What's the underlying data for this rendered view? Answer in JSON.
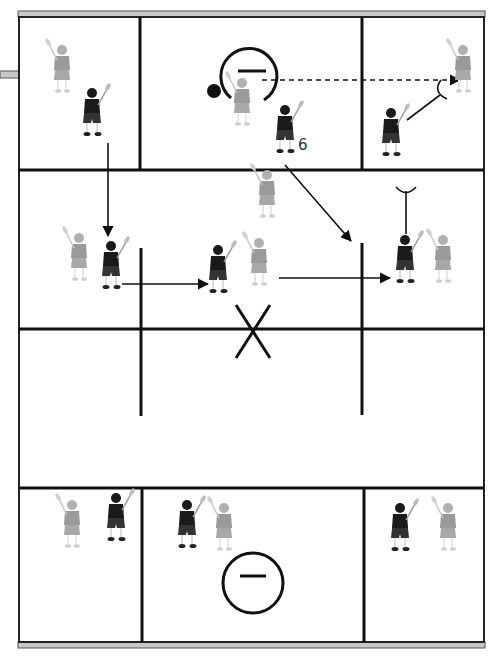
{
  "diagram": {
    "colors": {
      "line": "#111111",
      "border_band": "#c8c8c8",
      "offense_player": "#1a1a1a",
      "defense_player": "#9a9a9a",
      "background": "#ffffff"
    },
    "labels": {
      "player_number": "6"
    },
    "symbols": {
      "crease_top": "goal-crease-with-goalie-dash",
      "crease_bottom": "goal-crease-with-goalie-dash",
      "ball": "ball",
      "center_mark": "X"
    },
    "players": [
      {
        "id": "p1",
        "team": "defense",
        "x": 62,
        "y": 72,
        "zone": "top-left"
      },
      {
        "id": "p2",
        "team": "offense",
        "x": 92,
        "y": 115,
        "zone": "top-left"
      },
      {
        "id": "p3",
        "team": "defense",
        "x": 242,
        "y": 105,
        "zone": "top-center"
      },
      {
        "id": "p4",
        "team": "offense",
        "x": 285,
        "y": 132,
        "zone": "top-center",
        "number": "6"
      },
      {
        "id": "p5",
        "team": "defense",
        "x": 463,
        "y": 72,
        "zone": "top-right"
      },
      {
        "id": "p6",
        "team": "offense",
        "x": 391,
        "y": 135,
        "zone": "top-right"
      },
      {
        "id": "p7",
        "team": "defense",
        "x": 267,
        "y": 197,
        "zone": "middle"
      },
      {
        "id": "p8",
        "team": "defense",
        "x": 79,
        "y": 260,
        "zone": "middle-left"
      },
      {
        "id": "p9",
        "team": "offense",
        "x": 111,
        "y": 268,
        "zone": "middle-left"
      },
      {
        "id": "p10",
        "team": "offense",
        "x": 218,
        "y": 272,
        "zone": "middle"
      },
      {
        "id": "p11",
        "team": "defense",
        "x": 259,
        "y": 265,
        "zone": "middle"
      },
      {
        "id": "p12",
        "team": "offense",
        "x": 405,
        "y": 262,
        "zone": "middle-right"
      },
      {
        "id": "p13",
        "team": "defense",
        "x": 443,
        "y": 262,
        "zone": "middle-right"
      },
      {
        "id": "p14",
        "team": "defense",
        "x": 72,
        "y": 527,
        "zone": "bottom-left"
      },
      {
        "id": "p15",
        "team": "offense",
        "x": 116,
        "y": 520,
        "zone": "bottom-left"
      },
      {
        "id": "p16",
        "team": "offense",
        "x": 187,
        "y": 527,
        "zone": "bottom-center"
      },
      {
        "id": "p17",
        "team": "defense",
        "x": 224,
        "y": 530,
        "zone": "bottom-center"
      },
      {
        "id": "p18",
        "team": "offense",
        "x": 400,
        "y": 530,
        "zone": "bottom-right"
      },
      {
        "id": "p19",
        "team": "defense",
        "x": 448,
        "y": 530,
        "zone": "bottom-right"
      }
    ],
    "movements": [
      {
        "type": "pass",
        "style": "dashed",
        "from": [
          262,
          80
        ],
        "to": [
          462,
          80
        ]
      },
      {
        "type": "cut",
        "style": "solid",
        "from": [
          108,
          143
        ],
        "to": [
          108,
          236
        ]
      },
      {
        "type": "cut",
        "style": "solid",
        "from": [
          122,
          284
        ],
        "to": [
          208,
          284
        ]
      },
      {
        "type": "cut",
        "style": "solid",
        "from": [
          278,
          178
        ],
        "to": [
          350,
          241
        ]
      },
      {
        "type": "cut",
        "style": "solid",
        "from": [
          279,
          278
        ],
        "to": [
          390,
          278
        ]
      },
      {
        "type": "pick",
        "style": "solid",
        "from": [
          405,
          234
        ],
        "to": [
          405,
          191
        ]
      },
      {
        "type": "pick",
        "style": "solid",
        "from": [
          407,
          120
        ],
        "to": [
          440,
          93
        ]
      }
    ]
  }
}
